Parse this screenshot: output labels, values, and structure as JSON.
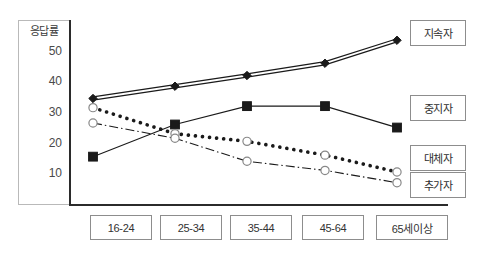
{
  "chart_data": {
    "type": "line",
    "title": "",
    "xlabel": "",
    "ylabel": "응답률",
    "categories": [
      "16-24",
      "25-34",
      "35-44",
      "45-64",
      "65세이상"
    ],
    "yticks": [
      10,
      20,
      30,
      40,
      50
    ],
    "ylim": [
      0,
      57
    ],
    "grid": false,
    "legend_position": "right",
    "series": [
      {
        "name": "지속자",
        "marker": "filled-diamond",
        "line_style": "double-solid",
        "values": [
          34.5,
          38.5,
          42,
          46,
          53.5
        ]
      },
      {
        "name": "중지자",
        "marker": "filled-square",
        "line_style": "solid",
        "values": [
          15.5,
          26,
          32,
          32,
          25
        ]
      },
      {
        "name": "대체자",
        "marker": "open-circle",
        "line_style": "thick-dotted",
        "values": [
          31.5,
          23,
          20.5,
          16,
          10.5
        ]
      },
      {
        "name": "추가자",
        "marker": "open-circle",
        "line_style": "dash-dot",
        "values": [
          26.5,
          21.5,
          14,
          11,
          7
        ]
      }
    ]
  },
  "axis": {
    "y_label": "응답률",
    "tick_50": "50",
    "tick_40": "40",
    "tick_30": "30",
    "tick_20": "20",
    "tick_10": "10"
  },
  "categories": {
    "c0": "16-24",
    "c1": "25-34",
    "c2": "35-44",
    "c3": "45-64",
    "c4": "65세이상"
  },
  "legend": {
    "l0": "지속자",
    "l1": "중지자",
    "l2": "대체자",
    "l3": "추가자"
  },
  "colors": {
    "line": "#1a1a1a",
    "axis": "#2b2b2b",
    "box_border": "#8d8d8d",
    "text": "#333333",
    "background": "#ffffff"
  }
}
